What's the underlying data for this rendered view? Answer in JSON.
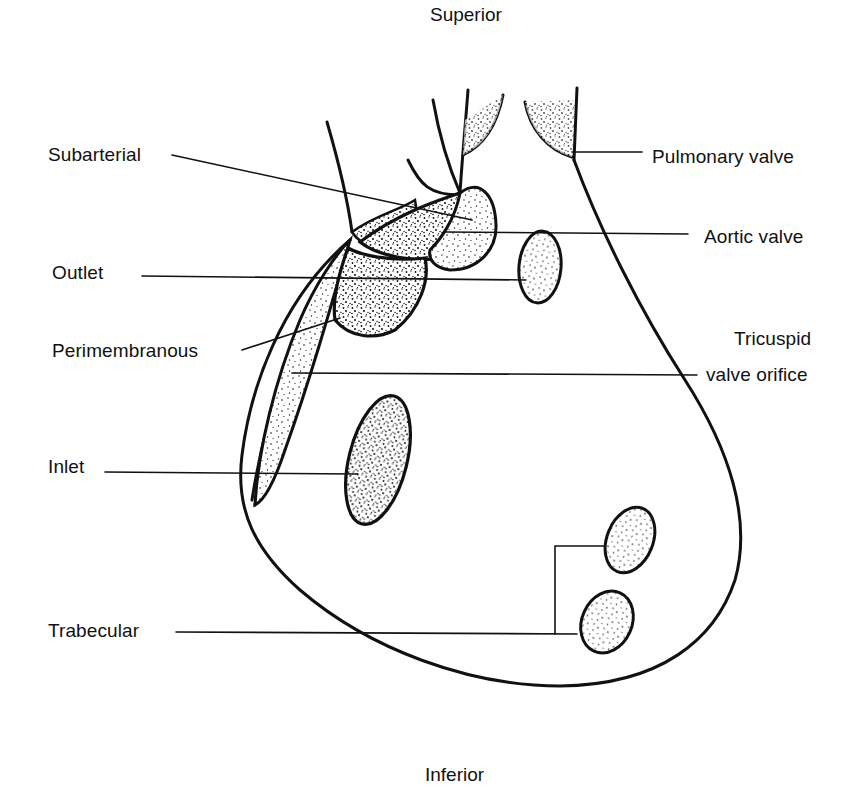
{
  "diagram": {
    "orientation": {
      "top": "Superior",
      "bottom": "Inferior"
    },
    "left_labels": [
      {
        "id": "subarterial",
        "text": "Subarterial"
      },
      {
        "id": "outlet",
        "text": "Outlet"
      },
      {
        "id": "perimembranous",
        "text": "Perimembranous"
      },
      {
        "id": "inlet",
        "text": "Inlet"
      },
      {
        "id": "trabecular",
        "text": "Trabecular"
      }
    ],
    "right_labels": [
      {
        "id": "pulmonary-valve",
        "text": "Pulmonary valve"
      },
      {
        "id": "aortic-valve",
        "text": "Aortic valve"
      },
      {
        "id": "tricuspid-line1",
        "text": "Tricuspid"
      },
      {
        "id": "tricuspid-line2",
        "text": "valve orifice"
      }
    ],
    "colors": {
      "ink": "#111111",
      "background": "#ffffff"
    }
  }
}
